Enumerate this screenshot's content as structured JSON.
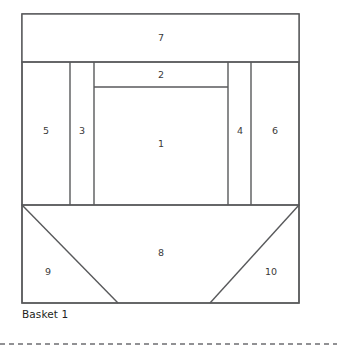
{
  "figure": {
    "caption": "Basket 1",
    "stroke_color": "#58595b",
    "background_color": "#ffffff",
    "label_color": "#3a3a3a"
  },
  "pieces": [
    {
      "id": "1",
      "label": "1",
      "x": 161,
      "y": 144
    },
    {
      "id": "2",
      "label": "2",
      "x": 161,
      "y": 74
    },
    {
      "id": "3",
      "label": "3",
      "x": 82,
      "y": 131
    },
    {
      "id": "4",
      "label": "4",
      "x": 240,
      "y": 131
    },
    {
      "id": "5",
      "label": "5",
      "x": 46,
      "y": 131
    },
    {
      "id": "6",
      "label": "6",
      "x": 275,
      "y": 131
    },
    {
      "id": "7",
      "label": "7",
      "x": 161,
      "y": 38
    },
    {
      "id": "8",
      "label": "8",
      "x": 161,
      "y": 253
    },
    {
      "id": "9",
      "label": "9",
      "x": 48,
      "y": 272
    },
    {
      "id": "10",
      "label": "10",
      "x": 271,
      "y": 272
    }
  ],
  "geometry": {
    "outer": {
      "left": 22,
      "right": 299,
      "top": 14,
      "bottom": 303
    },
    "rows": {
      "top_band_bottom": 62,
      "piece2_bottom": 87,
      "middle_bottom": 205
    },
    "columns": {
      "c1": 70,
      "c2": 94,
      "c3": 228,
      "c4": 251
    },
    "basket_apex_left_x": 118,
    "basket_apex_right_x": 210
  },
  "divider": {
    "name": "dashed-separator",
    "y": 344,
    "dash_pattern": "5 4"
  }
}
